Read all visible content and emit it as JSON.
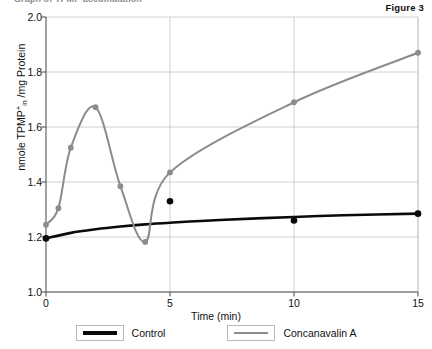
{
  "figure": {
    "label": "Figure 3",
    "clipped_heading": "Graph of TPMP accumulation"
  },
  "legend": {
    "position": "bottom-center",
    "entries": [
      {
        "name": "Control",
        "label": "Control",
        "color": "#0a0a0a",
        "swatch_icon": "line-swatch-black"
      },
      {
        "name": "Concanavalin A",
        "label": "Concanavalin A",
        "color": "#8c8c8c",
        "swatch_icon": "line-swatch-gray"
      }
    ]
  },
  "axes": {
    "xlabel": "Time  (min)",
    "ylabel_html": "nmole TPMP<sup>+</sup><sub>in</sub> /mg Protein",
    "ylabel_plain": "nmole TPMP+in /mg Protein",
    "xticks": [
      "0",
      "5",
      "10",
      "15"
    ],
    "yticks": [
      "1.0",
      "1.2",
      "1.4",
      "1.6",
      "1.8",
      "2.0"
    ]
  },
  "chart_data": {
    "type": "line",
    "title": "",
    "subtitle": "",
    "annotation": "Figure 3",
    "xlabel": "Time  (min)",
    "ylabel": "nmole TPMP+in /mg Protein",
    "xlim": [
      0,
      15
    ],
    "ylim": [
      1.0,
      2.0
    ],
    "xticks": [
      0,
      5,
      10,
      15
    ],
    "yticks": [
      1.0,
      1.2,
      1.4,
      1.6,
      1.8,
      2.0
    ],
    "grid": true,
    "grid_axis": "both",
    "legend": true,
    "legend_position": "bottom",
    "series": [
      {
        "name": "Control",
        "color": "#0a0a0a",
        "marker": "filled-circle",
        "linewidth": 2.6,
        "smooth": true,
        "points": [
          {
            "x": 0,
            "y": 1.195
          },
          {
            "x": 5,
            "y": 1.33
          },
          {
            "x": 10,
            "y": 1.26
          },
          {
            "x": 15,
            "y": 1.285
          }
        ],
        "curve_points": [
          {
            "x": 0,
            "y": 1.195
          },
          {
            "x": 1,
            "y": 1.215
          },
          {
            "x": 2,
            "y": 1.228
          },
          {
            "x": 3,
            "y": 1.238
          },
          {
            "x": 4,
            "y": 1.246
          },
          {
            "x": 5,
            "y": 1.252
          },
          {
            "x": 7,
            "y": 1.262
          },
          {
            "x": 10,
            "y": 1.273
          },
          {
            "x": 12,
            "y": 1.279
          },
          {
            "x": 15,
            "y": 1.285
          }
        ]
      },
      {
        "name": "Concanavalin A",
        "color": "#8c8c8c",
        "marker": "filled-circle",
        "linewidth": 2.0,
        "smooth": true,
        "points": [
          {
            "x": 0.0,
            "y": 1.245
          },
          {
            "x": 0.5,
            "y": 1.305
          },
          {
            "x": 1.0,
            "y": 1.525
          },
          {
            "x": 2.0,
            "y": 1.672
          },
          {
            "x": 3.0,
            "y": 1.385
          },
          {
            "x": 4.0,
            "y": 1.182
          },
          {
            "x": 5.0,
            "y": 1.435
          },
          {
            "x": 10.0,
            "y": 1.69
          },
          {
            "x": 15.0,
            "y": 1.87
          }
        ]
      }
    ]
  }
}
